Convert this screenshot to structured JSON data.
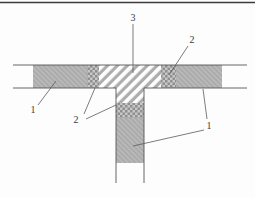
{
  "figure": {
    "type": "technical-cross-section-diagram",
    "callouts": [
      {
        "id": "label-1-left",
        "text": "1"
      },
      {
        "id": "label-2-left",
        "text": "2"
      },
      {
        "id": "label-3-top",
        "text": "3"
      },
      {
        "id": "label-2-right",
        "text": "2"
      },
      {
        "id": "label-1-right",
        "text": "1"
      }
    ],
    "colors": {
      "border": "#3c3c3c",
      "line": "#565656",
      "leader": "#5a5a5a",
      "label": "#3a3a3a",
      "gray_fill": "#b9b9b9",
      "gray_hatch_line": "#a2a2a2",
      "checker_dark": "#8f8f8f",
      "checker_light": "#c7c7c7",
      "stripe": "#adadad",
      "stripe_bg": "#ffffff",
      "background": "#fdfdfd"
    }
  }
}
